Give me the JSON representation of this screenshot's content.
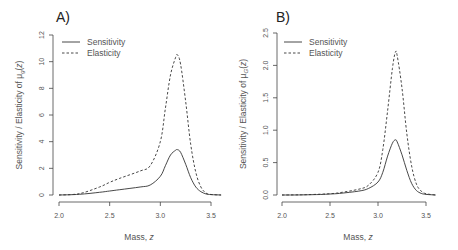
{
  "chart_data": [
    {
      "type": "line",
      "panel_label": "A)",
      "title": "",
      "xlabel": "Mass, z",
      "ylabel": "Sensitivity / Elasticity of μ_g(z)",
      "ylabel_parts": {
        "prefix": "Sensitivity / Elasticity of μ",
        "sub": "g",
        "suffix": "(z)"
      },
      "xlim": [
        2.0,
        3.6
      ],
      "ylim": [
        0,
        12
      ],
      "xticks": [
        2.0,
        2.5,
        3.0,
        3.5
      ],
      "xtick_labels": [
        "2.0",
        "2.5",
        "3.0",
        "3.5"
      ],
      "yticks": [
        0,
        2,
        4,
        6,
        8,
        10,
        12
      ],
      "ytick_labels": [
        "0",
        "2",
        "4",
        "6",
        "8",
        "10",
        "12"
      ],
      "grid": false,
      "legend_position": "top-left",
      "x": [
        2.0,
        2.2,
        2.4,
        2.5,
        2.6,
        2.8,
        2.9,
        3.0,
        3.05,
        3.1,
        3.15,
        3.17,
        3.2,
        3.25,
        3.3,
        3.35,
        3.4,
        3.45,
        3.5,
        3.6
      ],
      "series": [
        {
          "name": "Sensitivity",
          "style": "solid",
          "values": [
            0.0,
            0.05,
            0.2,
            0.3,
            0.4,
            0.6,
            0.75,
            1.4,
            2.2,
            3.0,
            3.35,
            3.4,
            3.2,
            2.3,
            1.3,
            0.6,
            0.25,
            0.08,
            0.03,
            0.0
          ]
        },
        {
          "name": "Elasticity",
          "style": "dashed",
          "values": [
            0.0,
            0.1,
            0.6,
            0.95,
            1.25,
            1.8,
            2.2,
            4.0,
            6.5,
            9.0,
            10.3,
            10.5,
            9.8,
            7.0,
            3.8,
            1.7,
            0.6,
            0.15,
            0.04,
            0.0
          ]
        }
      ]
    },
    {
      "type": "line",
      "panel_label": "B)",
      "title": "",
      "xlabel": "Mass, z",
      "ylabel": "Sensitivity / Elasticity of μ_G(z)",
      "ylabel_parts": {
        "prefix": "Sensitivity / Elasticity of μ",
        "sub": "G",
        "suffix": "(z)"
      },
      "xlim": [
        2.0,
        3.6
      ],
      "ylim": [
        0,
        2.5
      ],
      "xticks": [
        2.0,
        2.5,
        3.0,
        3.5
      ],
      "xtick_labels": [
        "2.0",
        "2.5",
        "3.0",
        "3.5"
      ],
      "yticks": [
        0.0,
        0.5,
        1.0,
        1.5,
        2.0,
        2.5
      ],
      "ytick_labels": [
        "0.0",
        "0.5",
        "1.0",
        "1.5",
        "2.0",
        "2.5"
      ],
      "grid": false,
      "legend_position": "top-left",
      "x": [
        2.0,
        2.2,
        2.4,
        2.5,
        2.6,
        2.8,
        2.9,
        3.0,
        3.05,
        3.1,
        3.15,
        3.18,
        3.2,
        3.25,
        3.3,
        3.35,
        3.4,
        3.45,
        3.5,
        3.6
      ],
      "series": [
        {
          "name": "Sensitivity",
          "style": "solid",
          "values": [
            0.0,
            0.002,
            0.008,
            0.015,
            0.025,
            0.06,
            0.1,
            0.2,
            0.35,
            0.6,
            0.8,
            0.85,
            0.82,
            0.62,
            0.38,
            0.18,
            0.07,
            0.025,
            0.01,
            0.0
          ]
        },
        {
          "name": "Elasticity",
          "style": "dashed",
          "values": [
            0.0,
            0.003,
            0.012,
            0.02,
            0.035,
            0.09,
            0.15,
            0.35,
            0.7,
            1.3,
            1.95,
            2.2,
            2.15,
            1.65,
            0.95,
            0.45,
            0.17,
            0.06,
            0.02,
            0.0
          ]
        }
      ]
    }
  ]
}
